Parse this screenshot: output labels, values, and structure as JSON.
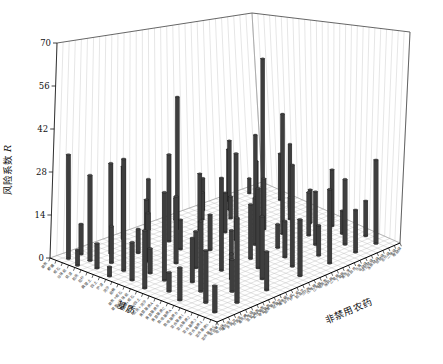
{
  "chart_data": {
    "type": "bar",
    "subtype": "3d-bar-perspective",
    "title": "",
    "ylabel_prefix": "风险系数",
    "ylabel_symbol": "R",
    "xlabel": "基质",
    "zlabel": "非禁用农药",
    "ylim": [
      0,
      70
    ],
    "yticks": [
      0,
      14,
      28,
      42,
      56,
      70
    ],
    "grid": true,
    "legend": "none",
    "bar_color": "#3e3e3e",
    "bar_top_color": "#4a4a4a",
    "bar_edge_color": "#161616",
    "wall_grid_color": "#cccccc",
    "floor_grid_color": "#b8b8b8",
    "x_categories": [
      "草炭",
      "椰糠",
      "蛭石",
      "珍珠岩",
      "菇渣",
      "稻壳",
      "秸秆",
      "腐殖土",
      "园土",
      "炉渣",
      "河沙",
      "岩棉",
      "草炭+蛭石",
      "草炭+珍珠岩",
      "椰糠+蛭石",
      "菇渣+园土",
      "稻壳+河沙",
      "育苗基质A",
      "育苗基质B",
      "育苗基质C",
      "栽培基质A",
      "栽培基质B",
      "混合基质1",
      "混合基质2",
      "混合基质3",
      "混合基质4",
      "混合基质5",
      "混合基质6"
    ],
    "z_categories": [
      "吡虫啉",
      "啶虫脒",
      "噻虫嗪",
      "多菌灵",
      "百菌清",
      "毒死蜱",
      "三唑磷",
      "氯氰菊酯",
      "氰戊菊酯",
      "甲氰菊酯",
      "联苯菊酯",
      "哒螨灵",
      "噻嗪酮",
      "异丙威",
      "仲丁威",
      "稻瘟灵",
      "三环唑",
      "戊唑醇",
      "己唑醇",
      "嘧菌酯",
      "咪鲜胺",
      "乙草胺",
      "丁草胺",
      "莠去津",
      "敌敌畏",
      "乐果",
      "辛硫磷",
      "马拉硫磷",
      "水胺硫磷",
      "倍硫磷",
      "杀扑磷",
      "二嗪磷",
      "喹硫磷"
    ],
    "bars_format": [
      "u_along_substrate_axis_0to1",
      "v_along_pesticide_axis_0to1",
      "risk_value_R"
    ],
    "bars": [
      [
        0.06,
        0.04,
        34
      ],
      [
        0.06,
        0.1,
        10
      ],
      [
        0.06,
        0.3,
        25
      ],
      [
        0.06,
        0.42,
        18
      ],
      [
        0.06,
        0.55,
        8
      ],
      [
        0.06,
        0.68,
        12
      ],
      [
        0.06,
        0.8,
        20
      ],
      [
        0.06,
        0.9,
        6
      ],
      [
        0.14,
        0.02,
        5
      ],
      [
        0.14,
        0.08,
        28
      ],
      [
        0.14,
        0.18,
        30
      ],
      [
        0.14,
        0.35,
        14
      ],
      [
        0.14,
        0.5,
        47
      ],
      [
        0.14,
        0.62,
        10
      ],
      [
        0.14,
        0.75,
        26
      ],
      [
        0.14,
        0.88,
        15
      ],
      [
        0.22,
        0.05,
        8
      ],
      [
        0.22,
        0.12,
        12
      ],
      [
        0.22,
        0.25,
        8
      ],
      [
        0.22,
        0.4,
        30
      ],
      [
        0.22,
        0.55,
        20
      ],
      [
        0.22,
        0.7,
        8
      ],
      [
        0.22,
        0.82,
        28
      ],
      [
        0.22,
        0.94,
        18
      ],
      [
        0.32,
        0.03,
        3
      ],
      [
        0.32,
        0.1,
        36
      ],
      [
        0.32,
        0.22,
        16
      ],
      [
        0.32,
        0.38,
        10
      ],
      [
        0.32,
        0.6,
        14
      ],
      [
        0.3,
        0.8,
        58
      ],
      [
        0.32,
        0.92,
        24
      ],
      [
        0.42,
        0.06,
        12
      ],
      [
        0.42,
        0.15,
        8
      ],
      [
        0.42,
        0.28,
        22
      ],
      [
        0.42,
        0.45,
        12
      ],
      [
        0.42,
        0.58,
        30
      ],
      [
        0.42,
        0.72,
        18
      ],
      [
        0.42,
        0.85,
        8
      ],
      [
        0.52,
        0.04,
        18
      ],
      [
        0.52,
        0.14,
        28
      ],
      [
        0.52,
        0.3,
        12
      ],
      [
        0.52,
        0.48,
        8
      ],
      [
        0.52,
        0.6,
        16
      ],
      [
        0.52,
        0.74,
        42
      ],
      [
        0.52,
        0.88,
        12
      ],
      [
        0.62,
        0.08,
        6
      ],
      [
        0.62,
        0.2,
        14
      ],
      [
        0.62,
        0.35,
        30
      ],
      [
        0.62,
        0.5,
        18
      ],
      [
        0.62,
        0.64,
        8
      ],
      [
        0.62,
        0.8,
        15
      ],
      [
        0.62,
        0.92,
        20
      ],
      [
        0.72,
        0.05,
        10
      ],
      [
        0.72,
        0.16,
        22
      ],
      [
        0.72,
        0.32,
        8
      ],
      [
        0.72,
        0.46,
        26
      ],
      [
        0.72,
        0.6,
        12
      ],
      [
        0.72,
        0.76,
        18
      ],
      [
        0.72,
        0.9,
        8
      ],
      [
        0.82,
        0.1,
        16
      ],
      [
        0.82,
        0.24,
        10
      ],
      [
        0.82,
        0.4,
        20
      ],
      [
        0.82,
        0.56,
        33
      ],
      [
        0.82,
        0.7,
        10
      ],
      [
        0.82,
        0.84,
        22
      ],
      [
        0.82,
        0.95,
        12
      ],
      [
        0.92,
        0.06,
        8
      ],
      [
        0.92,
        0.18,
        26
      ],
      [
        0.92,
        0.34,
        12
      ],
      [
        0.92,
        0.52,
        18
      ],
      [
        0.92,
        0.68,
        24
      ],
      [
        0.92,
        0.82,
        14
      ],
      [
        0.92,
        0.93,
        28
      ]
    ]
  }
}
